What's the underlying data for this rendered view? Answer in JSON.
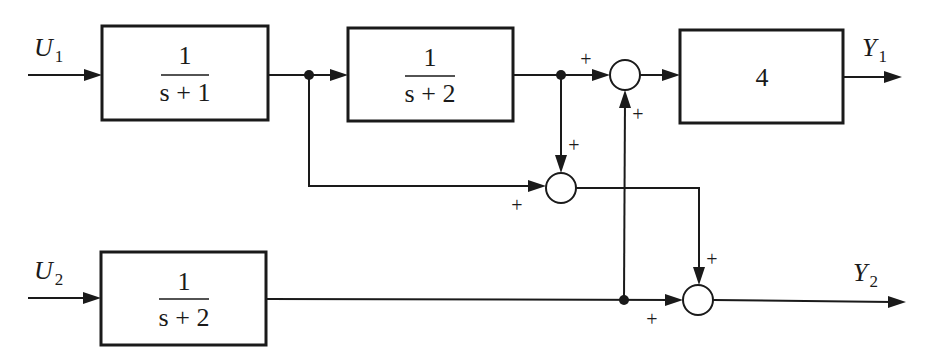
{
  "diagram": {
    "type": "block-diagram",
    "inputs": [
      {
        "id": "U1",
        "main": "U",
        "sub": "1"
      },
      {
        "id": "U2",
        "main": "U",
        "sub": "2"
      }
    ],
    "outputs": [
      {
        "id": "Y1",
        "main": "Y",
        "sub": "1"
      },
      {
        "id": "Y2",
        "main": "Y",
        "sub": "2"
      }
    ],
    "blocks": [
      {
        "id": "G1",
        "numerator": "1",
        "denominator": "s + 1"
      },
      {
        "id": "G2",
        "numerator": "1",
        "denominator": "s + 2"
      },
      {
        "id": "G3",
        "gain": "4"
      },
      {
        "id": "G4",
        "numerator": "1",
        "denominator": "s + 2"
      }
    ],
    "summing_junctions": [
      {
        "id": "S1",
        "signs": [
          "+",
          "+"
        ]
      },
      {
        "id": "S2",
        "signs": [
          "+",
          "+"
        ]
      },
      {
        "id": "S3",
        "signs": [
          "+",
          "+"
        ]
      }
    ],
    "connections": [
      "U1 -> G1",
      "G1 -> G2",
      "G1 -> S2 (+)",
      "G2 -> S1 (+)",
      "G2 -> S2 (+)",
      "G4 -> S1 (+)",
      "S1 -> G3",
      "G3 -> Y1",
      "U2 -> G4",
      "G4 -> S3 (+)",
      "S2 -> S3 (+)",
      "S3 -> Y2"
    ]
  }
}
